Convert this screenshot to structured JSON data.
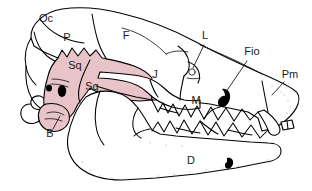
{
  "figure": {
    "background_color": "#ffffff",
    "outline_color": "#000000",
    "highlight_color": "#e8c3c8",
    "highlight_region_name": "squamosal-and-auditory-bulla"
  },
  "labels": [
    {
      "id": "oc",
      "text": "Oc",
      "meaning": "occipital",
      "x": 46,
      "y": 22,
      "has_leader": false
    },
    {
      "id": "p",
      "text": "P",
      "meaning": "parietal",
      "x": 67,
      "y": 41,
      "has_leader": false
    },
    {
      "id": "f",
      "text": "F",
      "meaning": "frontal",
      "x": 126,
      "y": 39,
      "has_leader": false
    },
    {
      "id": "l",
      "text": "L",
      "meaning": "lacrimal",
      "x": 205,
      "y": 39,
      "has_leader": true
    },
    {
      "id": "fio",
      "text": "Fio",
      "meaning": "infraorbital foramen",
      "x": 244,
      "y": 55,
      "has_leader": true
    },
    {
      "id": "pm",
      "text": "Pm",
      "meaning": "premaxilla",
      "x": 286,
      "y": 78,
      "has_leader": true
    },
    {
      "id": "sq1",
      "text": "Sq",
      "meaning": "squamosal",
      "x": 75,
      "y": 69,
      "has_leader": false
    },
    {
      "id": "sq2",
      "text": "Sq",
      "meaning": "squamosal",
      "x": 90,
      "y": 88,
      "has_leader": false
    },
    {
      "id": "j",
      "text": "J",
      "meaning": "jugal",
      "x": 155,
      "y": 78,
      "has_leader": false
    },
    {
      "id": "m",
      "text": "M",
      "meaning": "maxilla",
      "x": 196,
      "y": 104,
      "has_leader": false
    },
    {
      "id": "b",
      "text": "B",
      "meaning": "auditory bulla",
      "x": 50,
      "y": 134,
      "has_leader": true
    },
    {
      "id": "d",
      "text": "D",
      "meaning": "dentary",
      "x": 191,
      "y": 164,
      "has_leader": false
    }
  ],
  "foramina": [
    {
      "id": "infraorbital-foramen",
      "label_ref": "fio",
      "x": 223,
      "y": 97
    },
    {
      "id": "mental-foramen",
      "label_ref": "d",
      "x": 228,
      "y": 163
    },
    {
      "id": "external-auditory-meatus",
      "label_ref": "b",
      "x": 62,
      "y": 91
    }
  ]
}
